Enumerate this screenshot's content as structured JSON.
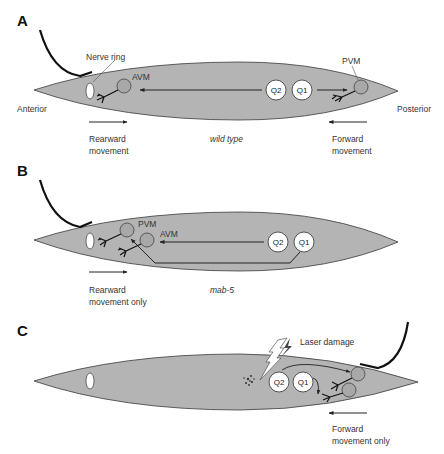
{
  "colors": {
    "worm_fill": "#b4b4b4",
    "worm_stroke": "#3a3a3a",
    "neuron_fill": "#a8a8a8",
    "q_cell_fill": "#ffffff",
    "text": "#333333",
    "laser_bolt": "#444444"
  },
  "panels": [
    {
      "id": "A",
      "label": "A",
      "genotype": "wild type",
      "labels": {
        "nerve_ring": "Nerve ring",
        "avm": "AVM",
        "pvm": "PVM",
        "anterior": "Anterior",
        "posterior": "Posterior",
        "q2": "Q2",
        "q1": "Q1"
      },
      "left_caption": [
        "Rearward",
        "movement"
      ],
      "right_caption": [
        "Forward",
        "movement"
      ]
    },
    {
      "id": "B",
      "label": "B",
      "genotype": "mab-5",
      "labels": {
        "pvm": "PVM",
        "avm": "AVM",
        "q2": "Q2",
        "q1": "Q1"
      },
      "left_caption": [
        "Rearward",
        "movement only"
      ]
    },
    {
      "id": "C",
      "label": "C",
      "labels": {
        "laser": "Laser damage",
        "q2": "Q2",
        "q1": "Q1"
      },
      "right_caption": [
        "Forward",
        "movement only"
      ]
    }
  ]
}
